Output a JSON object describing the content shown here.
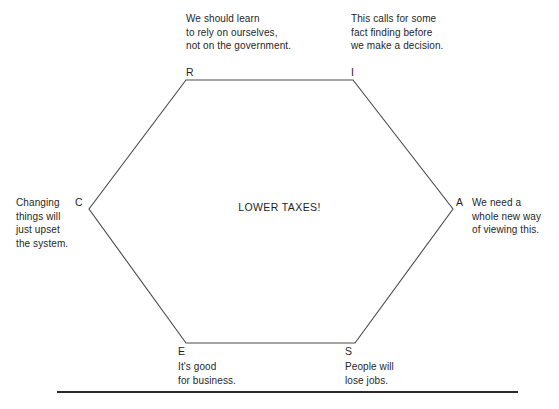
{
  "diagram": {
    "type": "hexagon-thinking-hats",
    "center_label": "LOWER TAXES!",
    "vertices": [
      {
        "id": "R",
        "letter": "R",
        "position": "top-left",
        "note": "We should learn\nto rely on ourselves,\nnot on the government."
      },
      {
        "id": "I",
        "letter": "I",
        "position": "top-right",
        "note": "This calls for some\nfact finding before\nwe make a decision."
      },
      {
        "id": "C",
        "letter": "C",
        "position": "left",
        "note": "Changing\nthings will\njust upset\nthe system."
      },
      {
        "id": "A",
        "letter": "A",
        "position": "right",
        "note": "We need a\nwhole new way\nof viewing this."
      },
      {
        "id": "E",
        "letter": "E",
        "position": "bottom-left",
        "note": "It's good\nfor business."
      },
      {
        "id": "S",
        "letter": "S",
        "position": "bottom-right",
        "note": "People will\nlose jobs."
      }
    ],
    "shape": {
      "points": "186,80 353,80 453,209 355,343 186,343 89,209",
      "stroke_color": "#4a4a4a",
      "stroke_width": 1,
      "fill": "none"
    },
    "rule": {
      "color": "#2b2b2b",
      "thickness": 2
    }
  }
}
